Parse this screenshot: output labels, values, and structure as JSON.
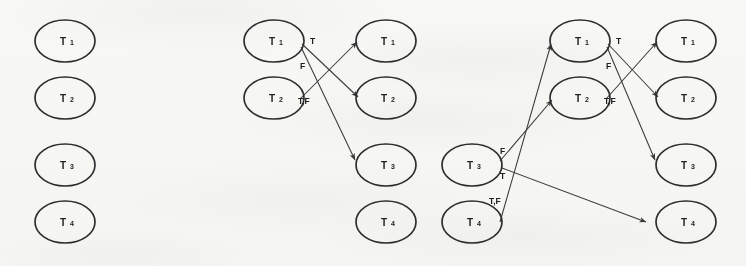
{
  "figure": {
    "kind": "handwritten-scan-diagram",
    "ink_color": "#2e2e30",
    "paper_color": "#fbfbfa",
    "edge_color": "#3a3a3d",
    "width": 746,
    "height": 266
  },
  "node_labels": {
    "t1": "T",
    "t1_sub": "1",
    "t2": "T",
    "t2_sub": "2",
    "t3": "T",
    "t3_sub": "3",
    "t4": "T",
    "t4_sub": "4"
  },
  "edge_labels": {
    "t": "T",
    "f": "F",
    "tf": "T,F"
  },
  "panels": [
    {
      "id": "panel-1",
      "name": "initial-state",
      "columns": [
        {
          "id": "p1-col-1",
          "nodes": [
            "T1",
            "T2",
            "T3",
            "T4"
          ]
        }
      ],
      "edges": []
    },
    {
      "id": "panel-2",
      "name": "first-step",
      "columns": [
        {
          "id": "p2-col-1",
          "nodes": [
            "T1",
            "T2"
          ]
        },
        {
          "id": "p2-col-2",
          "nodes": [
            "T1",
            "T2",
            "T3",
            "T4"
          ]
        }
      ],
      "edges": [
        {
          "from": "T1",
          "to": "T2",
          "label": "T"
        },
        {
          "from": "T1",
          "to": "T3",
          "label": "F"
        },
        {
          "from": "T2",
          "to": "T1",
          "label": "T,F"
        }
      ]
    },
    {
      "id": "panel-3",
      "name": "second-step",
      "columns": [
        {
          "id": "p3-col-1",
          "nodes": [
            "T3",
            "T4"
          ]
        },
        {
          "id": "p3-col-2",
          "nodes": [
            "T1",
            "T2"
          ]
        },
        {
          "id": "p3-col-3",
          "nodes": [
            "T1",
            "T2",
            "T3",
            "T4"
          ]
        }
      ],
      "edges": [
        {
          "from": "T3",
          "to": "T2",
          "label": "F"
        },
        {
          "from": "T3",
          "to": "T4",
          "label": "T"
        },
        {
          "from": "T4",
          "to": "T1",
          "label": "T,F"
        },
        {
          "from": "T1",
          "to": "T2",
          "label": "T"
        },
        {
          "from": "T1",
          "to": "T3",
          "label": "F"
        },
        {
          "from": "T2",
          "to": "T1",
          "label": "T,F"
        }
      ]
    }
  ],
  "geometry": {
    "ellipse_rx": 30,
    "ellipse_ry": 21,
    "row_y": [
      41,
      98,
      165,
      222
    ],
    "col_x": [
      65,
      274,
      386,
      472,
      580,
      686
    ]
  }
}
